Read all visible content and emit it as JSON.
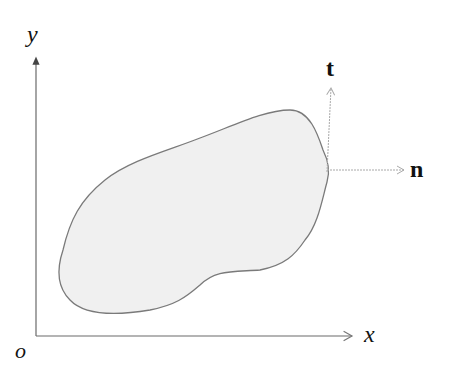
{
  "diagram": {
    "labels": {
      "y_axis": "y",
      "x_axis": "x",
      "origin": "o",
      "tangent": "t",
      "normal": "n"
    },
    "colors": {
      "axis": "#6a6a6a",
      "region_fill": "#f0f0f0",
      "region_stroke": "#7a7a7a",
      "vector": "#a8a8a8",
      "text": "#111111"
    }
  }
}
